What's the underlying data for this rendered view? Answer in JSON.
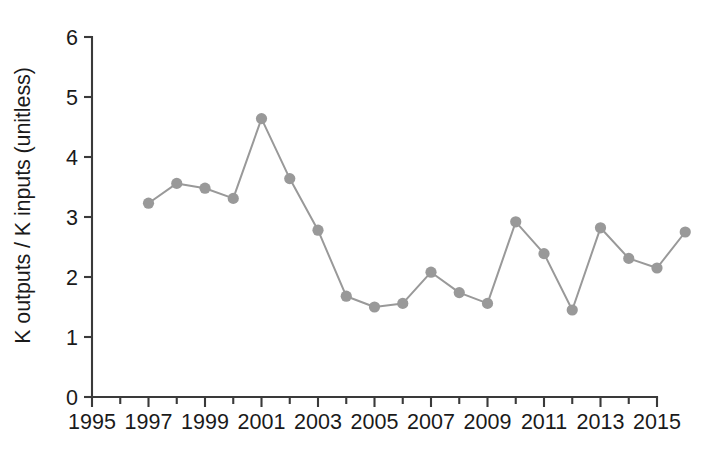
{
  "chart_data": {
    "type": "line",
    "title": "",
    "subtitle": "",
    "xlabel": "",
    "ylabel": "K outputs / K inputs (unitless)",
    "xlim": [
      1995,
      2015
    ],
    "ylim": [
      0,
      6
    ],
    "x_tick_labels": [
      "1995",
      "1997",
      "1999",
      "2001",
      "2003",
      "2005",
      "2007",
      "2009",
      "2011",
      "2013",
      "2015"
    ],
    "x_tick_values": [
      1995,
      1997,
      1999,
      2001,
      2003,
      2005,
      2007,
      2009,
      2011,
      2013,
      2015
    ],
    "x_minor_tick_interval": 1,
    "y_tick_labels": [
      "0",
      "1",
      "2",
      "3",
      "4",
      "5",
      "6"
    ],
    "y_tick_values": [
      0,
      1,
      2,
      3,
      4,
      5,
      6
    ],
    "grid": false,
    "legend": "none",
    "marker": "circle",
    "series": [
      {
        "name": "K outputs / K inputs",
        "color": "#999999",
        "x": [
          1997,
          1998,
          1999,
          2000,
          2001,
          2002,
          2003,
          2004,
          2005,
          2006,
          2007,
          2008,
          2009,
          2010,
          2011,
          2012,
          2013,
          2014
        ],
        "values": [
          3.23,
          3.56,
          3.48,
          3.31,
          4.64,
          3.64,
          2.78,
          1.68,
          1.5,
          1.56,
          2.08,
          1.74,
          1.56,
          2.92,
          2.39,
          1.45,
          2.82,
          2.31
        ]
      }
    ],
    "points": [
      {
        "year": 1997,
        "value": 3.23
      },
      {
        "year": 1998,
        "value": 3.56
      },
      {
        "year": 1999,
        "value": 3.48
      },
      {
        "year": 2000,
        "value": 3.31
      },
      {
        "year": 2001,
        "value": 4.64
      },
      {
        "year": 2002,
        "value": 3.64
      },
      {
        "year": 2003,
        "value": 2.78
      },
      {
        "year": 2004,
        "value": 1.68
      },
      {
        "year": 2005,
        "value": 1.5
      },
      {
        "year": 2006,
        "value": 1.56
      },
      {
        "year": 2007,
        "value": 2.08
      },
      {
        "year": 2008,
        "value": 1.74
      },
      {
        "year": 2009,
        "value": 1.56
      },
      {
        "year": 2010,
        "value": 2.92
      },
      {
        "year": 2011,
        "value": 2.39
      },
      {
        "year": 2012,
        "value": 1.45
      },
      {
        "year": 2013,
        "value": 2.82
      },
      {
        "year": 2014,
        "value": 2.31
      },
      {
        "year": 2015,
        "value": 2.15
      },
      {
        "year": 2016,
        "value": 2.75
      }
    ],
    "colors": {
      "series": "#999999",
      "axis": "#3a3a3a",
      "text": "#1a1a1a",
      "background": "#ffffff"
    }
  }
}
